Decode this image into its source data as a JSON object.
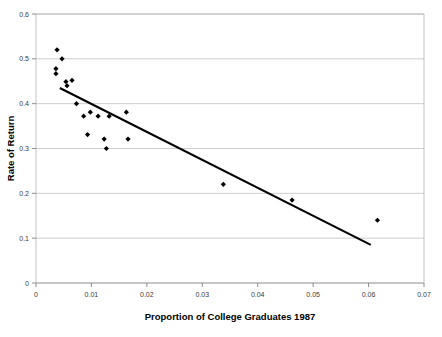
{
  "chart_data": {
    "type": "scatter",
    "title": "",
    "xlabel": "Proportion of College Graduates 1987",
    "ylabel": "Rate of Return",
    "xlim": [
      0,
      0.07
    ],
    "ylim": [
      0,
      0.6
    ],
    "grid": true,
    "legend": false,
    "xticks": [
      0,
      0.01,
      0.02,
      0.03,
      0.04,
      0.05,
      0.06,
      0.07
    ],
    "xtick_labels": [
      "0",
      "0.01",
      "0.02",
      "0.03",
      "0.04",
      "0.05",
      "0.06",
      "0.07"
    ],
    "yticks": [
      0,
      0.1,
      0.2,
      0.3,
      0.4,
      0.5,
      0.6
    ],
    "ytick_labels": [
      "0",
      "0.1",
      "0.2",
      "0.3",
      "0.4",
      "0.5",
      "0.6"
    ],
    "marker": "diamond",
    "marker_color": "#000000",
    "points": [
      {
        "x": 0.0038,
        "y": 0.52
      },
      {
        "x": 0.0047,
        "y": 0.5
      },
      {
        "x": 0.0036,
        "y": 0.478
      },
      {
        "x": 0.0036,
        "y": 0.467
      },
      {
        "x": 0.0054,
        "y": 0.449
      },
      {
        "x": 0.0065,
        "y": 0.452
      },
      {
        "x": 0.0056,
        "y": 0.44
      },
      {
        "x": 0.0073,
        "y": 0.4
      },
      {
        "x": 0.0086,
        "y": 0.372
      },
      {
        "x": 0.0098,
        "y": 0.381
      },
      {
        "x": 0.0112,
        "y": 0.372
      },
      {
        "x": 0.0132,
        "y": 0.372
      },
      {
        "x": 0.0163,
        "y": 0.381
      },
      {
        "x": 0.0093,
        "y": 0.331
      },
      {
        "x": 0.0123,
        "y": 0.321
      },
      {
        "x": 0.0127,
        "y": 0.3
      },
      {
        "x": 0.0166,
        "y": 0.321
      },
      {
        "x": 0.0338,
        "y": 0.22
      },
      {
        "x": 0.0462,
        "y": 0.185
      },
      {
        "x": 0.0616,
        "y": 0.14
      }
    ],
    "trendline": {
      "type": "linear",
      "color": "#000000",
      "x_start": 0.0043,
      "y_start": 0.435,
      "x_end": 0.0604,
      "y_end": 0.085
    }
  }
}
